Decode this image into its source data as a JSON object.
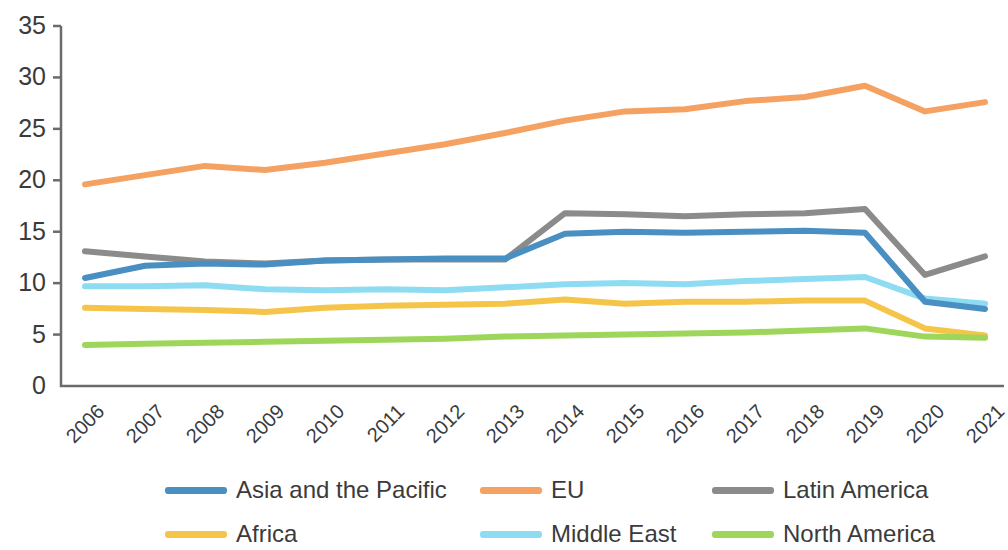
{
  "chart_data": {
    "type": "line",
    "title": "",
    "subtitle": "",
    "xlabel": "",
    "ylabel": "",
    "categories": [
      "2006",
      "2007",
      "2008",
      "2009",
      "2010",
      "2011",
      "2012",
      "2013",
      "2014",
      "2015",
      "2016",
      "2017",
      "2018",
      "2019",
      "2020",
      "2021"
    ],
    "x": [
      2006,
      2007,
      2008,
      2009,
      2010,
      2011,
      2012,
      2013,
      2014,
      2015,
      2016,
      2017,
      2018,
      2019,
      2020,
      2021
    ],
    "ylim": [
      0,
      35
    ],
    "yticks": [
      0,
      5,
      10,
      15,
      20,
      25,
      30,
      35
    ],
    "ytick_labels": [
      "0",
      "5",
      "10",
      "15",
      "20",
      "25",
      "30",
      "35"
    ],
    "grid": false,
    "legend_position": "bottom",
    "series": [
      {
        "name": "Asia and the Pacific",
        "color": "#4a8fc2",
        "values": [
          10.5,
          11.7,
          11.9,
          11.8,
          12.2,
          12.3,
          12.4,
          12.4,
          14.8,
          15.0,
          14.9,
          15.0,
          15.1,
          14.9,
          8.2,
          7.5
        ]
      },
      {
        "name": "EU",
        "color": "#f4a162",
        "values": [
          19.6,
          20.5,
          21.4,
          21.0,
          21.7,
          22.6,
          23.5,
          24.6,
          25.8,
          26.7,
          26.9,
          27.7,
          28.1,
          29.2,
          26.7,
          27.6
        ]
      },
      {
        "name": "Latin America",
        "color": "#8b8b8b",
        "values": [
          13.1,
          12.6,
          12.1,
          11.9,
          12.2,
          12.3,
          12.3,
          12.3,
          16.8,
          16.7,
          16.5,
          16.7,
          16.8,
          17.2,
          10.8,
          12.6
        ]
      },
      {
        "name": "Africa",
        "color": "#f5c54a",
        "values": [
          7.6,
          7.5,
          7.4,
          7.2,
          7.6,
          7.8,
          7.9,
          8.0,
          8.4,
          8.0,
          8.2,
          8.2,
          8.3,
          8.3,
          5.6,
          4.9
        ]
      },
      {
        "name": "Middle East",
        "color": "#8ddcf2",
        "values": [
          9.7,
          9.7,
          9.8,
          9.4,
          9.3,
          9.4,
          9.3,
          9.6,
          9.9,
          10.0,
          9.9,
          10.2,
          10.4,
          10.6,
          8.5,
          8.0
        ]
      },
      {
        "name": "North America",
        "color": "#9ed65c",
        "values": [
          4.0,
          4.1,
          4.2,
          4.3,
          4.4,
          4.5,
          4.6,
          4.8,
          4.9,
          5.0,
          5.1,
          5.2,
          5.4,
          5.6,
          4.8,
          4.7
        ]
      }
    ]
  },
  "legend": {
    "items": [
      {
        "label": "Asia and the Pacific",
        "color": "#4a8fc2"
      },
      {
        "label": "EU",
        "color": "#f4a162"
      },
      {
        "label": "Latin America",
        "color": "#8b8b8b"
      },
      {
        "label": "Africa",
        "color": "#f5c54a"
      },
      {
        "label": "Middle East",
        "color": "#8ddcf2"
      },
      {
        "label": "North America",
        "color": "#9ed65c"
      }
    ]
  },
  "axis": {
    "color": "#6b6b6b"
  }
}
